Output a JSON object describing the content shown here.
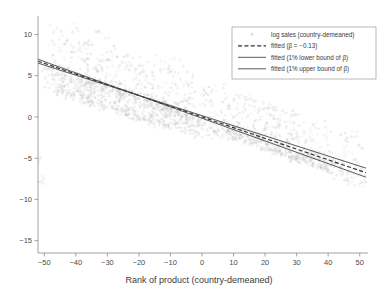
{
  "chart_data": {
    "type": "scatter",
    "title": "",
    "xlabel": "Rank of product (country-demeaned)",
    "ylabel": "",
    "xlim": [
      -52,
      52
    ],
    "ylim": [
      -16.5,
      12.0
    ],
    "xticks": [
      -50,
      -40,
      -30,
      -20,
      -10,
      0,
      10,
      20,
      30,
      40,
      50
    ],
    "xticklabels": [
      "-50",
      "-40",
      "-30",
      "-20",
      "-10",
      "0",
      "10",
      "20",
      "30",
      "40",
      "50"
    ],
    "yticks": [
      10,
      5,
      0,
      -5,
      -10,
      -15
    ],
    "yticklabels": [
      "10",
      "5",
      "0",
      "-5",
      "-10",
      "-15"
    ],
    "grid": false,
    "legend_position": "top-right",
    "series": [
      {
        "name": "log sales (country-demeaned)",
        "type": "scatter",
        "marker": "circle",
        "color": "#b9b9b9",
        "n_points": 2600,
        "description": "Dense downward-sloping cloud of country-demeaned log sales against product rank; wide vertical spread at negative ranks narrowing to the right, with a density break near rank 0."
      },
      {
        "name": "fitted (β = −0.13)",
        "type": "line",
        "style": "dashed",
        "color": "#2e2e2e",
        "slope": -0.13,
        "intercept": 0.0,
        "endpoints": [
          [
            -52,
            6.76
          ],
          [
            52,
            -6.76
          ]
        ]
      },
      {
        "name": "fitted (1% lower bound of β)",
        "type": "line",
        "style": "solid",
        "color": "#3d3d3d",
        "slope": -0.1225,
        "intercept": 0.16,
        "endpoints": [
          [
            -52,
            6.53
          ],
          [
            52,
            -6.21
          ]
        ]
      },
      {
        "name": "fitted (1% upper bound of β)",
        "type": "line",
        "style": "solid",
        "color": "#3d3d3d",
        "slope": -0.1375,
        "intercept": -0.16,
        "endpoints": [
          [
            -52,
            6.99
          ],
          [
            52,
            -7.31
          ]
        ]
      }
    ],
    "legend_entries": [
      {
        "label": "log sales (country-demeaned)",
        "marker": "dot"
      },
      {
        "label": "fitted (β = −0.13)",
        "marker": "dashed-line"
      },
      {
        "label": "fitted (1% lower bound of β)",
        "marker": "solid-line"
      },
      {
        "label": "fitted (1% upper bound of β)",
        "marker": "solid-line"
      }
    ],
    "scatter_envelope": {
      "comment": "Piecewise vertical extent of the point cloud at sampled ranks: [rank, y_low, y_high, density_weight]",
      "points": [
        [
          -50,
          3.6,
          11.4,
          0.55
        ],
        [
          -45,
          2.9,
          10.6,
          0.75
        ],
        [
          -40,
          2.2,
          9.9,
          0.9
        ],
        [
          -35,
          1.6,
          9.2,
          1.0
        ],
        [
          -30,
          1.0,
          8.6,
          1.0
        ],
        [
          -25,
          0.4,
          8.0,
          1.0
        ],
        [
          -20,
          -0.2,
          7.3,
          1.0
        ],
        [
          -15,
          -0.8,
          6.7,
          1.0
        ],
        [
          -10,
          -1.3,
          6.0,
          1.0
        ],
        [
          -5,
          -1.8,
          5.4,
          0.95
        ],
        [
          0,
          -2.2,
          4.7,
          0.6
        ],
        [
          5,
          -2.0,
          3.9,
          0.55
        ],
        [
          10,
          -2.6,
          3.2,
          0.7
        ],
        [
          15,
          -3.2,
          2.6,
          0.8
        ],
        [
          20,
          -3.9,
          1.9,
          0.85
        ],
        [
          25,
          -4.5,
          1.3,
          0.85
        ],
        [
          30,
          -5.2,
          0.6,
          0.8
        ],
        [
          35,
          -5.9,
          0.0,
          0.7
        ],
        [
          40,
          -6.6,
          -0.6,
          0.6
        ],
        [
          45,
          -7.4,
          -1.2,
          0.45
        ],
        [
          50,
          -8.2,
          -1.8,
          0.3
        ]
      ]
    }
  }
}
